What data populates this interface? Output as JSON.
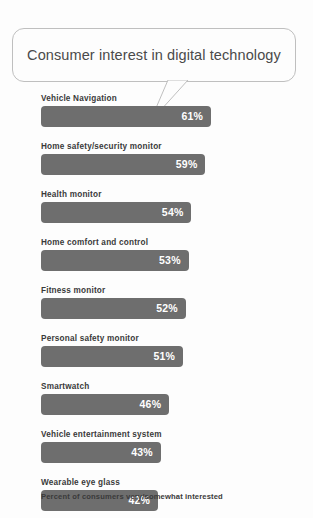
{
  "title": "Consumer interest in digital technology",
  "footnote": "Percent of consumers very/somewhat interested",
  "colors": {
    "bar": "#6e6e6e",
    "bar_value_text": "#ffffff",
    "label_text": "#3a3a3a",
    "background": "#fdfdfd",
    "bubble_border": "#bfbfbf"
  },
  "chart_data": {
    "type": "bar",
    "orientation": "horizontal",
    "title": "Consumer interest in digital technology",
    "xlabel": "",
    "ylabel": "",
    "xlim": [
      0,
      70
    ],
    "grid": false,
    "legend": "none",
    "value_suffix": "%",
    "annotation": "Percent of consumers very/somewhat interested",
    "categories": [
      "Vehicle Navigation",
      "Home safety/security monitor",
      "Health monitor",
      "Home comfort and control",
      "Fitness monitor",
      "Personal safety monitor",
      "Smartwatch",
      "Vehicle entertainment system",
      "Wearable eye glass"
    ],
    "values": [
      61,
      59,
      54,
      53,
      52,
      51,
      46,
      43,
      42
    ],
    "value_labels": [
      "61%",
      "59%",
      "54%",
      "53%",
      "52%",
      "51%",
      "46%",
      "43%",
      "42%"
    ]
  }
}
